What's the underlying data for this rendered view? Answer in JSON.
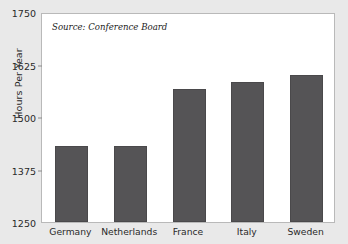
{
  "chart_data": {
    "type": "bar",
    "title": "",
    "subtitle": "",
    "xlabel": "",
    "ylabel": "Hours Per Year",
    "categories": [
      "Germany",
      "Netherlands",
      "France",
      "Italy",
      "Sweden"
    ],
    "values": [
      1430,
      1431,
      1567,
      1584,
      1601
    ],
    "ylim": [
      1250,
      1750
    ],
    "yticks": [
      1250,
      1375,
      1500,
      1625,
      1750
    ],
    "ytick_labels": [
      "1250",
      "1375",
      "1500",
      "1625",
      "1750"
    ],
    "grid": false,
    "legend": null,
    "annotations": [
      {
        "name": "source-note",
        "text": "Source: Conference Board"
      }
    ],
    "series_color": "#555456",
    "plot_background": "#ffffff",
    "figure_background": "#e9e9e9"
  },
  "axes": {
    "y_title": "Hours Per Year"
  },
  "note": {
    "source": "Source: Conference Board"
  }
}
